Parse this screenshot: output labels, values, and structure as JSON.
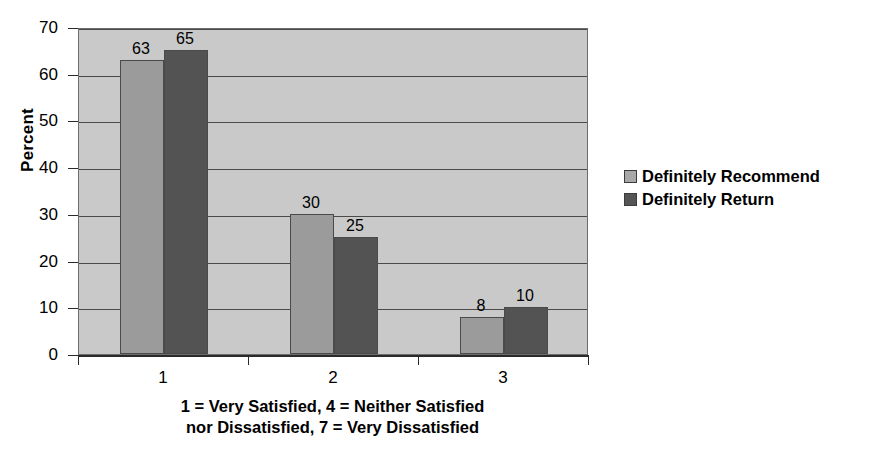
{
  "chart_data": {
    "type": "bar",
    "title": "",
    "xlabel": "1 = Very Satisfied, 4 = Neither Satisfied nor Dissatisfied, 7 = Very Dissatisfied",
    "xlabel_lines": [
      "1 = Very Satisfied, 4 = Neither Satisfied",
      "nor Dissatisfied, 7 = Very Dissatisfied"
    ],
    "ylabel": "Percent",
    "categories": [
      "1",
      "2",
      "3"
    ],
    "series": [
      {
        "name": "Definitely Recommend",
        "color": "#9b9b9b",
        "values": [
          63,
          30,
          8
        ]
      },
      {
        "name": "Definitely Return",
        "color": "#535353",
        "values": [
          65,
          25,
          10
        ]
      }
    ],
    "ylim": [
      0,
      70
    ],
    "yticks": [
      0,
      10,
      20,
      30,
      40,
      50,
      60,
      70
    ],
    "ytick_labels": [
      "0",
      "10",
      "20",
      "30",
      "40",
      "50",
      "60",
      "70"
    ],
    "grid": true,
    "grid_axis": "y",
    "legend_position": "right",
    "plot_background": "#c9c9c9",
    "figure_background": "#ffffff"
  }
}
